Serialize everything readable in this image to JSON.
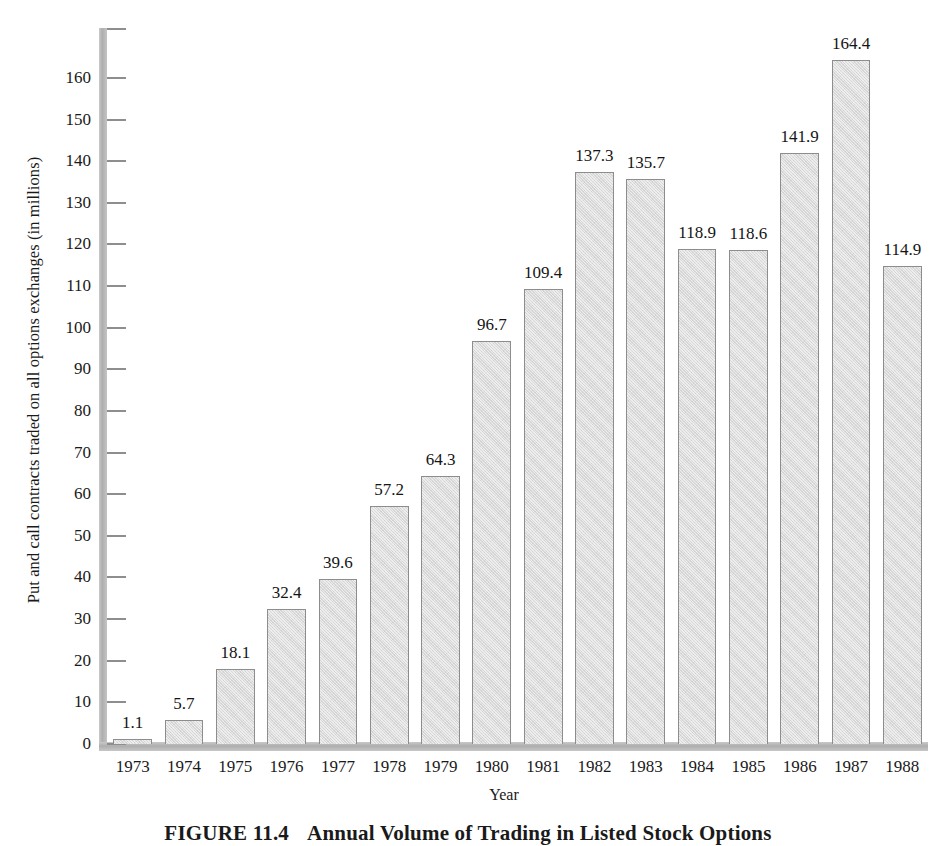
{
  "chart_data": {
    "type": "bar",
    "title": "Annual Volume of Trading in Listed Stock Options",
    "figure_number": "FIGURE 11.4",
    "xlabel": "Year",
    "ylabel": "Put and call contracts traded on all options exchanges (in millions)",
    "categories": [
      "1973",
      "1974",
      "1975",
      "1976",
      "1977",
      "1978",
      "1979",
      "1980",
      "1981",
      "1982",
      "1983",
      "1984",
      "1985",
      "1986",
      "1987",
      "1988"
    ],
    "values": [
      1.1,
      5.7,
      18.1,
      32.4,
      39.6,
      57.2,
      64.3,
      96.7,
      109.4,
      137.3,
      135.7,
      118.9,
      118.6,
      141.9,
      164.4,
      114.9
    ],
    "value_labels": [
      "1.1",
      "5.7",
      "18.1",
      "32.4",
      "39.6",
      "57.2",
      "64.3",
      "96.7",
      "109.4",
      "137.3",
      "135.7",
      "118.9",
      "118.6",
      "141.9",
      "164.4",
      "114.9"
    ],
    "ylim": [
      0,
      172
    ],
    "yticks": [
      0,
      10,
      20,
      30,
      40,
      50,
      60,
      70,
      80,
      90,
      100,
      110,
      120,
      130,
      140,
      150,
      160
    ],
    "ytick_labels": [
      "0",
      "10",
      "20",
      "30",
      "40",
      "50",
      "60",
      "70",
      "80",
      "90",
      "100",
      "110",
      "120",
      "130",
      "140",
      "150",
      "160"
    ],
    "grid": false,
    "legend": null,
    "bar_fill_color": "#d9d9d9",
    "bar_border_color": "#8d8d8d",
    "axis_color": "#b0b0b0",
    "text_color": "#151515"
  },
  "caption": {
    "figure_label": "FIGURE 11.4",
    "figure_title": "Annual Volume of Trading in Listed Stock Options"
  }
}
